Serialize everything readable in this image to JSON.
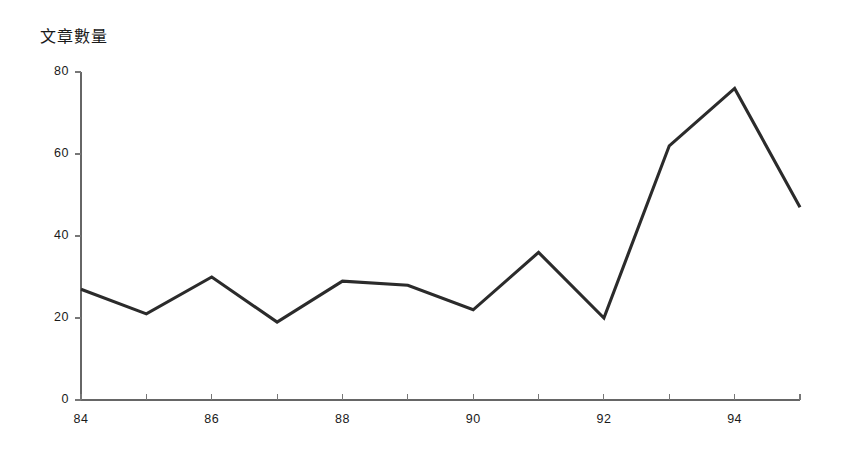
{
  "chart_data": {
    "type": "line",
    "title": "文章數量",
    "xlabel": "",
    "ylabel": "",
    "x": [
      84,
      85,
      86,
      87,
      88,
      89,
      90,
      91,
      92,
      93,
      94,
      95
    ],
    "values": [
      27,
      21,
      30,
      19,
      29,
      28,
      22,
      36,
      20,
      62,
      76,
      47
    ],
    "series": [
      {
        "name": "文章數量",
        "values": [
          27,
          21,
          30,
          19,
          29,
          28,
          22,
          36,
          20,
          62,
          76,
          47
        ]
      }
    ],
    "xlim": [
      84,
      95
    ],
    "ylim": [
      0,
      80
    ],
    "y_ticks": [
      0,
      20,
      40,
      60,
      80
    ],
    "y_tick_labels": [
      "0",
      "20",
      "40",
      "60",
      "80"
    ],
    "x_ticks": [
      84,
      85,
      86,
      87,
      88,
      89,
      90,
      91,
      92,
      93,
      94,
      95
    ],
    "x_tick_labels": [
      "84",
      "",
      "86",
      "",
      "88",
      "",
      "90",
      "",
      "92",
      "",
      "94",
      ""
    ],
    "x_labeled_ticks": [
      {
        "x": 84,
        "label": "84"
      },
      {
        "x": 86,
        "label": "86"
      },
      {
        "x": 88,
        "label": "88"
      },
      {
        "x": 90,
        "label": "90"
      },
      {
        "x": 92,
        "label": "92"
      },
      {
        "x": 94,
        "label": "94"
      }
    ],
    "grid": false,
    "legend": null,
    "line_color": "#2b2b2b",
    "axis_color": "#666666",
    "background_color": "#ffffff"
  }
}
